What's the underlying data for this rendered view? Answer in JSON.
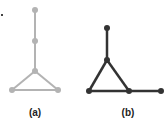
{
  "figure": {
    "panels": [
      {
        "label": "(a)",
        "color": "#b3b3b3",
        "nodes": [
          [
            35,
            10
          ],
          [
            35,
            41
          ],
          [
            35,
            71
          ],
          [
            12,
            90
          ],
          [
            58,
            90
          ]
        ],
        "edges": [
          [
            0,
            1
          ],
          [
            1,
            2
          ],
          [
            2,
            3
          ],
          [
            2,
            4
          ],
          [
            3,
            4
          ]
        ]
      },
      {
        "label": "(b)",
        "color": "#333333",
        "nodes": [
          [
            107,
            28
          ],
          [
            107,
            60
          ],
          [
            89,
            91
          ],
          [
            129,
            91
          ],
          [
            161,
            91
          ]
        ],
        "edges": [
          [
            0,
            1
          ],
          [
            1,
            2
          ],
          [
            1,
            3
          ],
          [
            2,
            3
          ],
          [
            3,
            4
          ]
        ]
      }
    ],
    "stray_mark": [
      2,
      15
    ]
  }
}
